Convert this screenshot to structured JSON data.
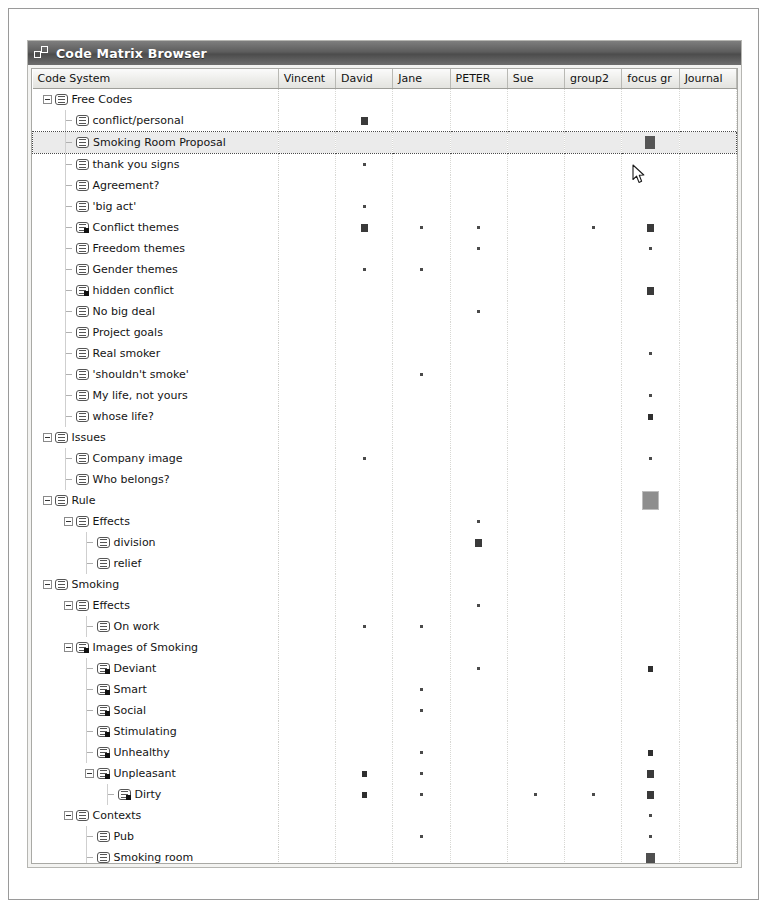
{
  "window": {
    "title": "Code Matrix Browser",
    "icon": "code-matrix-icon"
  },
  "table": {
    "code_column_header": "Code System",
    "document_columns": [
      "Vincent",
      "David",
      "Jane",
      "PETER",
      "Sue",
      "group2",
      "focus gr",
      "Journal"
    ]
  },
  "chart_data": {
    "type": "table",
    "title": "Code Matrix Browser",
    "xlabel": "Documents",
    "ylabel": "Code System",
    "categories": [
      "Vincent",
      "David",
      "Jane",
      "PETER",
      "Sue",
      "group2",
      "focus gr",
      "Journal"
    ],
    "note": "Cell values are symbol-size codes 0-5 where 0 = no marker, 1 = tiny dot, 2 = small square, 3 = medium square, 4 = large square, 5 = extra-large gray square"
  },
  "rows": [
    {
      "label": "Free Codes",
      "depth": 0,
      "toggle": "minus",
      "icon": "code-icon",
      "selected": false,
      "values": [
        0,
        0,
        0,
        0,
        0,
        0,
        0,
        0
      ]
    },
    {
      "label": "conflict/personal",
      "depth": 1,
      "toggle": "none",
      "icon": "code-icon",
      "selected": false,
      "values": [
        0,
        3,
        0,
        0,
        0,
        0,
        0,
        0
      ]
    },
    {
      "label": "Smoking Room Proposal",
      "depth": 1,
      "toggle": "none",
      "icon": "code-icon",
      "selected": true,
      "values": [
        0,
        0,
        0,
        0,
        0,
        0,
        6,
        0
      ]
    },
    {
      "label": "thank you signs",
      "depth": 1,
      "toggle": "none",
      "icon": "code-icon",
      "selected": false,
      "values": [
        0,
        1,
        0,
        0,
        0,
        0,
        0,
        0
      ]
    },
    {
      "label": "Agreement?",
      "depth": 1,
      "toggle": "none",
      "icon": "code-icon",
      "selected": false,
      "values": [
        0,
        0,
        0,
        0,
        0,
        0,
        0,
        0
      ]
    },
    {
      "label": "'big act'",
      "depth": 1,
      "toggle": "none",
      "icon": "code-icon",
      "selected": false,
      "values": [
        0,
        1,
        0,
        0,
        0,
        0,
        0,
        0
      ]
    },
    {
      "label": "Conflict themes",
      "depth": 1,
      "toggle": "none",
      "icon": "code-memo-icon",
      "selected": false,
      "values": [
        0,
        3,
        1,
        1,
        0,
        1,
        3,
        0
      ]
    },
    {
      "label": "Freedom themes",
      "depth": 1,
      "toggle": "none",
      "icon": "code-icon",
      "selected": false,
      "values": [
        0,
        0,
        0,
        1,
        0,
        0,
        1,
        0
      ]
    },
    {
      "label": "Gender themes",
      "depth": 1,
      "toggle": "none",
      "icon": "code-icon",
      "selected": false,
      "values": [
        0,
        1,
        1,
        0,
        0,
        0,
        0,
        0
      ]
    },
    {
      "label": "hidden conflict",
      "depth": 1,
      "toggle": "none",
      "icon": "code-memo-icon",
      "selected": false,
      "values": [
        0,
        0,
        0,
        0,
        0,
        0,
        3,
        0
      ]
    },
    {
      "label": "No big deal",
      "depth": 1,
      "toggle": "none",
      "icon": "code-icon",
      "selected": false,
      "values": [
        0,
        0,
        0,
        1,
        0,
        0,
        0,
        0
      ]
    },
    {
      "label": "Project goals",
      "depth": 1,
      "toggle": "none",
      "icon": "code-icon",
      "selected": false,
      "values": [
        0,
        0,
        0,
        0,
        0,
        0,
        0,
        0
      ]
    },
    {
      "label": "Real smoker",
      "depth": 1,
      "toggle": "none",
      "icon": "code-icon",
      "selected": false,
      "values": [
        0,
        0,
        0,
        0,
        0,
        0,
        1,
        0
      ]
    },
    {
      "label": "'shouldn't smoke'",
      "depth": 1,
      "toggle": "none",
      "icon": "code-icon",
      "selected": false,
      "values": [
        0,
        0,
        1,
        0,
        0,
        0,
        0,
        0
      ]
    },
    {
      "label": "My life, not yours",
      "depth": 1,
      "toggle": "none",
      "icon": "code-icon",
      "selected": false,
      "values": [
        0,
        0,
        0,
        0,
        0,
        0,
        1,
        0
      ]
    },
    {
      "label": "whose life?",
      "depth": 1,
      "toggle": "none",
      "icon": "code-icon",
      "selected": false,
      "values": [
        0,
        0,
        0,
        0,
        0,
        0,
        2,
        0
      ]
    },
    {
      "label": "Issues",
      "depth": 0,
      "toggle": "minus",
      "icon": "code-icon",
      "selected": false,
      "values": [
        0,
        0,
        0,
        0,
        0,
        0,
        0,
        0
      ]
    },
    {
      "label": "Company image",
      "depth": 1,
      "toggle": "none",
      "icon": "code-icon",
      "selected": false,
      "values": [
        0,
        1,
        0,
        0,
        0,
        0,
        1,
        0
      ]
    },
    {
      "label": "Who belongs?",
      "depth": 1,
      "toggle": "none",
      "icon": "code-icon",
      "selected": false,
      "values": [
        0,
        0,
        0,
        0,
        0,
        0,
        0,
        0
      ]
    },
    {
      "label": "Rule",
      "depth": 0,
      "toggle": "minus",
      "icon": "code-icon",
      "selected": false,
      "values": [
        0,
        0,
        0,
        0,
        0,
        0,
        5,
        0
      ]
    },
    {
      "label": "Effects",
      "depth": 1,
      "toggle": "minus",
      "icon": "code-icon",
      "selected": false,
      "values": [
        0,
        0,
        0,
        1,
        0,
        0,
        0,
        0
      ]
    },
    {
      "label": "division",
      "depth": 2,
      "toggle": "none",
      "icon": "code-icon",
      "selected": false,
      "values": [
        0,
        0,
        0,
        3,
        0,
        0,
        0,
        0
      ]
    },
    {
      "label": "relief",
      "depth": 2,
      "toggle": "none",
      "icon": "code-icon",
      "selected": false,
      "values": [
        0,
        0,
        0,
        0,
        0,
        0,
        0,
        0
      ]
    },
    {
      "label": "Smoking",
      "depth": 0,
      "toggle": "minus",
      "icon": "code-icon",
      "selected": false,
      "values": [
        0,
        0,
        0,
        0,
        0,
        0,
        0,
        0
      ]
    },
    {
      "label": "Effects",
      "depth": 1,
      "toggle": "minus",
      "icon": "code-icon",
      "selected": false,
      "values": [
        0,
        0,
        0,
        1,
        0,
        0,
        0,
        0
      ]
    },
    {
      "label": "On work",
      "depth": 2,
      "toggle": "none",
      "icon": "code-icon",
      "selected": false,
      "values": [
        0,
        1,
        1,
        0,
        0,
        0,
        0,
        0
      ]
    },
    {
      "label": "Images of Smoking",
      "depth": 1,
      "toggle": "minus",
      "icon": "code-memo-icon",
      "selected": false,
      "values": [
        0,
        0,
        0,
        0,
        0,
        0,
        0,
        0
      ]
    },
    {
      "label": "Deviant",
      "depth": 2,
      "toggle": "none",
      "icon": "code-memo-icon",
      "selected": false,
      "values": [
        0,
        0,
        0,
        1,
        0,
        0,
        2,
        0
      ]
    },
    {
      "label": "Smart",
      "depth": 2,
      "toggle": "none",
      "icon": "code-memo-icon",
      "selected": false,
      "values": [
        0,
        0,
        1,
        0,
        0,
        0,
        0,
        0
      ]
    },
    {
      "label": "Social",
      "depth": 2,
      "toggle": "none",
      "icon": "code-memo-icon",
      "selected": false,
      "values": [
        0,
        0,
        1,
        0,
        0,
        0,
        0,
        0
      ]
    },
    {
      "label": "Stimulating",
      "depth": 2,
      "toggle": "none",
      "icon": "code-memo-icon",
      "selected": false,
      "values": [
        0,
        0,
        0,
        0,
        0,
        0,
        0,
        0
      ]
    },
    {
      "label": "Unhealthy",
      "depth": 2,
      "toggle": "none",
      "icon": "code-memo-icon",
      "selected": false,
      "values": [
        0,
        0,
        1,
        0,
        0,
        0,
        2,
        0
      ]
    },
    {
      "label": "Unpleasant",
      "depth": 2,
      "toggle": "minus",
      "icon": "code-memo-icon",
      "selected": false,
      "values": [
        0,
        2,
        1,
        0,
        0,
        0,
        3,
        0
      ]
    },
    {
      "label": "Dirty",
      "depth": 3,
      "toggle": "none",
      "icon": "code-memo-icon",
      "selected": false,
      "values": [
        0,
        2,
        1,
        0,
        1,
        1,
        3,
        0
      ]
    },
    {
      "label": "Contexts",
      "depth": 1,
      "toggle": "minus",
      "icon": "code-icon",
      "selected": false,
      "values": [
        0,
        0,
        0,
        0,
        0,
        0,
        1,
        0
      ]
    },
    {
      "label": "Pub",
      "depth": 2,
      "toggle": "none",
      "icon": "code-icon",
      "selected": false,
      "values": [
        0,
        0,
        1,
        0,
        0,
        0,
        1,
        0
      ]
    },
    {
      "label": "Smoking room",
      "depth": 2,
      "toggle": "none",
      "icon": "code-icon",
      "selected": false,
      "values": [
        0,
        0,
        0,
        0,
        0,
        0,
        4,
        0
      ]
    },
    {
      "label": "Workplace",
      "depth": 2,
      "toggle": "none",
      "icon": "code-icon",
      "selected": false,
      "values": [
        0,
        1,
        3,
        2,
        0,
        0,
        0,
        0
      ]
    },
    {
      "label": "Outside",
      "depth": 2,
      "toggle": "none",
      "icon": "code-icon",
      "selected": false,
      "values": [
        0,
        0,
        0,
        0,
        0,
        0,
        1,
        0
      ]
    },
    {
      "label": "'belongs' where?",
      "depth": 2,
      "toggle": "none",
      "icon": "code-icon",
      "selected": false,
      "values": [
        0,
        0,
        1,
        1,
        0,
        0,
        2,
        0
      ]
    }
  ],
  "cursor": {
    "name": "mouse-pointer",
    "x": 631,
    "y": 163
  }
}
